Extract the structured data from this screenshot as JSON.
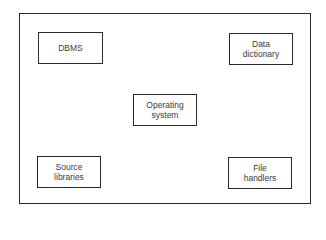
{
  "diagram": {
    "type": "component-block-diagram",
    "frame": {
      "label": ""
    },
    "nodes": [
      {
        "id": "dbms",
        "lines": [
          "DBMS"
        ],
        "position": "top-left"
      },
      {
        "id": "data-dictionary",
        "lines": [
          "Data",
          "dictionary"
        ],
        "position": "top-right"
      },
      {
        "id": "operating-system",
        "lines": [
          "Operating",
          "system"
        ],
        "position": "center"
      },
      {
        "id": "source-libraries",
        "lines": [
          "Source",
          "libraries"
        ],
        "position": "bottom-left"
      },
      {
        "id": "file-handlers",
        "lines": [
          "File",
          "handlers"
        ],
        "position": "bottom-right"
      }
    ],
    "colors": {
      "stroke": "#2b2b2b",
      "text": "#3a3a3a",
      "background": "#ffffff"
    }
  }
}
